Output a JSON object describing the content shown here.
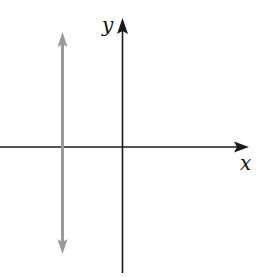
{
  "diagram": {
    "type": "coordinate-plane",
    "x_axis": {
      "label": "x",
      "color": "#1a1a1a"
    },
    "y_axis": {
      "label": "y",
      "color": "#1a1a1a"
    },
    "vertical_line": {
      "description": "vertical line left of y-axis with arrows both ends",
      "color": "#9a9a9a"
    }
  }
}
